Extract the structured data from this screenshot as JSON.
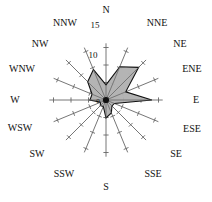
{
  "figure": {
    "kind": "wind-rose",
    "background_color": "#ffffff",
    "axis_color": "#666666",
    "outline_color": "#111111",
    "fill_color": "#b0b0b0",
    "center_x": 106,
    "center_y": 100,
    "pixels_per_unit": 3.5
  },
  "chart_data": {
    "type": "radar",
    "title": "",
    "subtitle": "",
    "xlabel": "",
    "ylabel": "",
    "legend": [],
    "grid": false,
    "legend_position": "none",
    "rlim": [
      0,
      17
    ],
    "radial_ticks": [
      0,
      5,
      10,
      15
    ],
    "radial_tick_labels": [
      "0",
      "",
      "10",
      "15"
    ],
    "labeled_radial_ticks": [
      {
        "value": 15,
        "label": "15"
      },
      {
        "value": 10,
        "label": "10"
      },
      {
        "value": 0,
        "label": "0"
      }
    ],
    "categories": [
      "N",
      "NNE",
      "NE",
      "ENE",
      "E",
      "ESE",
      "SE",
      "SSE",
      "S",
      "SSW",
      "SW",
      "WSW",
      "W",
      "WNW",
      "NW",
      "NNW"
    ],
    "category_angles_deg": [
      0,
      22.5,
      45,
      67.5,
      90,
      112.5,
      135,
      157.5,
      180,
      202.5,
      225,
      247.5,
      270,
      292.5,
      315,
      337.5
    ],
    "values": [
      4.3,
      10.3,
      13.2,
      6.1,
      13.1,
      2.6,
      2.4,
      4.0,
      5.1,
      2.0,
      2.3,
      1.7,
      4.6,
      4.3,
      7.4,
      9.4
    ],
    "series": [
      {
        "name": "frequency",
        "values": [
          4.3,
          10.3,
          13.2,
          6.1,
          13.1,
          2.6,
          2.4,
          4.0,
          5.1,
          2.0,
          2.3,
          1.7,
          4.6,
          4.3,
          7.4,
          9.4
        ]
      }
    ]
  },
  "labels": {
    "N": {
      "text": "N",
      "x": 106,
      "y": 13
    },
    "NNE": {
      "text": "NNE",
      "x": 157,
      "y": 26
    },
    "NE": {
      "text": "NE",
      "x": 180,
      "y": 47
    },
    "ENE": {
      "text": "ENE",
      "x": 192,
      "y": 72
    },
    "E": {
      "text": "E",
      "x": 196,
      "y": 103
    },
    "ESE": {
      "text": "ESE",
      "x": 192,
      "y": 132
    },
    "SE": {
      "text": "SE",
      "x": 176,
      "y": 157
    },
    "SSE": {
      "text": "SSE",
      "x": 153,
      "y": 177
    },
    "S": {
      "text": "S",
      "x": 106,
      "y": 190
    },
    "SSW": {
      "text": "SSW",
      "x": 64,
      "y": 177
    },
    "SW": {
      "text": "SW",
      "x": 37,
      "y": 157
    },
    "WSW": {
      "text": "WSW",
      "x": 20,
      "y": 131
    },
    "W": {
      "text": "W",
      "x": 15,
      "y": 103
    },
    "WNW": {
      "text": "WNW",
      "x": 22,
      "y": 72
    },
    "NW": {
      "text": "NW",
      "x": 40,
      "y": 47
    },
    "NNW": {
      "text": "NNW",
      "x": 65,
      "y": 26
    }
  },
  "tick_labels": {
    "fifteen": {
      "text": "15",
      "x": 95,
      "y": 28
    },
    "ten": {
      "text": "10",
      "x": 93,
      "y": 58
    },
    "zero": {
      "text": "0",
      "x": 98,
      "y": 103
    }
  }
}
